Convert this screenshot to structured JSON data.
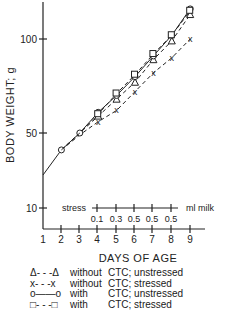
{
  "chart_data": {
    "type": "line",
    "title": "",
    "xlabel": "DAYS OF AGE",
    "ylabel": "BODY WEIGHT; g",
    "x": [
      2,
      3,
      4,
      5,
      6,
      7,
      8,
      9
    ],
    "x_ticks": [
      "1",
      "2",
      "3",
      "4",
      "5",
      "6",
      "7",
      "8",
      "9"
    ],
    "y_ticks": [
      "10",
      "50",
      "100"
    ],
    "series": [
      {
        "name": "without CTC; unstressed",
        "marker": "triangle",
        "line": "dashed",
        "values": [
          41,
          50,
          59,
          68,
          77,
          89,
          99,
          113
        ]
      },
      {
        "name": "without CTC; stressed",
        "marker": "x",
        "line": "dashed",
        "values": [
          41,
          49,
          56,
          62,
          72,
          82,
          90,
          100
        ]
      },
      {
        "name": "with CTC; unstressed",
        "marker": "circle",
        "line": "solid",
        "values": [
          41,
          50,
          61,
          70,
          80,
          91,
          102,
          116
        ]
      },
      {
        "name": "with CTC; stressed",
        "marker": "square",
        "line": "dashed",
        "values": [
          41,
          50,
          60,
          71,
          81,
          92,
          102,
          115
        ]
      }
    ],
    "annotations": {
      "stress_label": "stress",
      "milk_label": "ml milk",
      "milk_days": [
        4,
        5,
        6,
        7,
        8
      ],
      "milk_values": [
        "0.1",
        "0.3",
        "0.5",
        "0.5",
        "0.5"
      ]
    },
    "grid": false,
    "legend_position": "bottom"
  },
  "legend": [
    {
      "sym": "Δ- - -Δ",
      "t1": "without",
      "t2": "CTC; unstressed"
    },
    {
      "sym": "x- - -x",
      "t1": "without",
      "t2": "CTC; stressed"
    },
    {
      "sym": "o——o",
      "t1": "with",
      "t2": "CTC; unstressed"
    },
    {
      "sym": "□- - -□",
      "t1": "with",
      "t2": "CTC; stressed"
    }
  ]
}
